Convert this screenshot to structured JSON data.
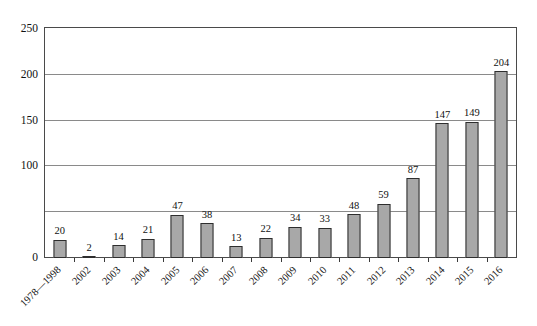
{
  "chart_data": {
    "type": "bar",
    "title": "",
    "subtitle": "",
    "xlabel": "",
    "ylabel": "",
    "ylim": [
      0,
      250
    ],
    "ytick_values": [
      0,
      50,
      100,
      150,
      200,
      250
    ],
    "ytick_labels": [
      "0",
      "",
      "100",
      "150",
      "200",
      "250"
    ],
    "grid": "horizontal",
    "legend": "none",
    "bar_fill_color": "#a8a8a8",
    "bar_border_color": "#2e2e2e",
    "axis_color": "#4a4a4a",
    "gridline_color": "#8a8a8a",
    "show_value_labels": true,
    "xtick_label_rotation": -45,
    "categories": [
      "1978—1998",
      "2002",
      "2003",
      "2004",
      "2005",
      "2006",
      "2007",
      "2008",
      "2009",
      "2010",
      "2011",
      "2012",
      "2013",
      "2014",
      "2015",
      "2016"
    ],
    "values": [
      20,
      2,
      14,
      21,
      47,
      38,
      13,
      22,
      34,
      33,
      48,
      59,
      87,
      147,
      149,
      204
    ],
    "value_labels": [
      "20",
      "2",
      "14",
      "21",
      "47",
      "38",
      "13",
      "22",
      "34",
      "33",
      "48",
      "59",
      "87",
      "147",
      "149",
      "204"
    ]
  }
}
